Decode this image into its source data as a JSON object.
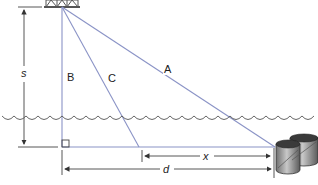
{
  "diagram": {
    "labels": {
      "s": "s",
      "B": "B",
      "C": "C",
      "A": "A",
      "x": "x",
      "d": "d"
    },
    "elements": {
      "platform": "oil-platform-truss-icon",
      "barrels": "barrels-icon",
      "water": "water-surface-waves",
      "right_angle": "right-angle-marker"
    },
    "colors": {
      "sight_lines": "#8a93c6",
      "dimension_lines": "#444444",
      "water": "#555555",
      "barrel_fill": "#9a9a9a"
    }
  }
}
